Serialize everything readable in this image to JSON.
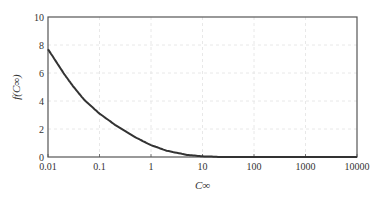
{
  "chart_data": {
    "type": "line",
    "title": "",
    "xlabel": "C_∞",
    "ylabel": "f(C_∞)",
    "xscale": "log",
    "xlim": [
      0.01,
      10000
    ],
    "ylim": [
      0,
      10
    ],
    "x_ticks": [
      "0.01",
      "0.1",
      "1",
      "10",
      "100",
      "1000",
      "10000"
    ],
    "y_ticks": [
      "0",
      "2",
      "4",
      "6",
      "8",
      "10"
    ],
    "grid": true,
    "legend": null,
    "series": [
      {
        "name": "f(C_∞)",
        "x": [
          0.01,
          0.02,
          0.03,
          0.05,
          0.1,
          0.2,
          0.5,
          1,
          2,
          5,
          10,
          20,
          50,
          100,
          10000
        ],
        "values": [
          7.7,
          6.0,
          5.1,
          4.1,
          3.1,
          2.3,
          1.4,
          0.85,
          0.45,
          0.15,
          0.05,
          0.01,
          0.0,
          0.0,
          0.0
        ]
      }
    ]
  }
}
